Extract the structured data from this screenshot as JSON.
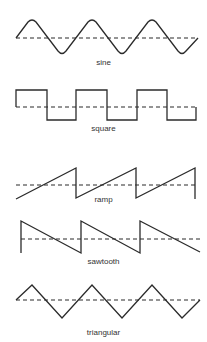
{
  "diagram": {
    "title": "",
    "waveforms": [
      {
        "id": "sine",
        "label": "sine",
        "label_y": 58
      },
      {
        "id": "square",
        "label": "square",
        "label_y": 124
      },
      {
        "id": "ramp",
        "label": "ramp",
        "label_y": 195
      },
      {
        "id": "sawtooth",
        "label": "sawtooth",
        "label_y": 257
      },
      {
        "id": "triangular",
        "label": "triangular",
        "label_y": 328
      }
    ],
    "colors": {
      "stroke": "#2b2b2b",
      "background": "#ffffff"
    }
  }
}
